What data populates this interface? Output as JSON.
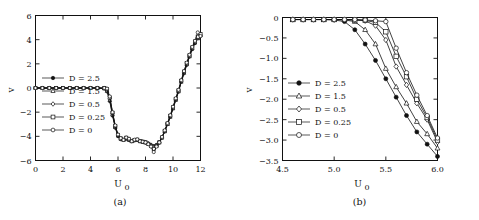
{
  "figure": {
    "panel_a_caption": "(a)",
    "panel_b_caption": "(b)"
  },
  "chart_data": [
    {
      "type": "line",
      "panel": "(a)",
      "title": "",
      "xlabel": "U_0",
      "ylabel": "v",
      "xlim": [
        0,
        12
      ],
      "ylim": [
        -6,
        6
      ],
      "xticks": [
        0,
        2,
        4,
        6,
        8,
        10,
        12
      ],
      "xticklabels": [
        "0",
        "2",
        "4",
        "6",
        "8",
        "10",
        "12"
      ],
      "yticks": [
        -6,
        -4,
        -2,
        0,
        2,
        4,
        6
      ],
      "yticklabels": [
        "-6",
        "-4",
        "-2",
        "0",
        "2",
        "4",
        "6"
      ],
      "grid": false,
      "legend_position": "center-left",
      "legend": [
        "D = 2.5",
        "D = 1.5",
        "D = 0.5",
        "D = 0.25",
        "D = 0"
      ],
      "markers": [
        "filled-circle",
        "triangle",
        "diamond",
        "square",
        "open-circle"
      ],
      "x": [
        0,
        0.5,
        1,
        1.5,
        2,
        2.5,
        3,
        3.5,
        4,
        4.5,
        5,
        5.2,
        5.4,
        5.6,
        5.8,
        6,
        6.2,
        6.4,
        6.6,
        6.8,
        7,
        7.2,
        7.4,
        7.6,
        7.8,
        8,
        8.2,
        8.4,
        8.6,
        8.8,
        9,
        9.2,
        9.4,
        9.6,
        9.8,
        10,
        10.2,
        10.4,
        10.6,
        10.8,
        11,
        11.2,
        11.4,
        11.6,
        11.8,
        12
      ],
      "series": [
        {
          "name": "D = 2.5",
          "values": [
            0,
            0,
            0,
            0,
            0,
            0,
            0,
            0,
            0,
            0,
            -0.05,
            -0.3,
            -1.1,
            -2.3,
            -3.3,
            -4.0,
            -4.25,
            -4.3,
            -4.2,
            -4.3,
            -4.4,
            -4.35,
            -4.3,
            -4.4,
            -4.45,
            -4.5,
            -4.6,
            -4.7,
            -4.8,
            -4.7,
            -4.5,
            -4.1,
            -3.6,
            -3.0,
            -2.4,
            -1.7,
            -1.0,
            -0.3,
            0.5,
            1.2,
            1.9,
            2.6,
            3.2,
            3.7,
            4.1,
            4.3
          ]
        },
        {
          "name": "D = 1.5",
          "values": [
            0,
            0,
            0,
            0,
            0,
            0,
            0,
            0,
            0,
            0,
            -0.04,
            -0.25,
            -1.0,
            -2.2,
            -3.25,
            -3.95,
            -4.2,
            -4.28,
            -4.2,
            -4.3,
            -4.4,
            -4.33,
            -4.3,
            -4.4,
            -4.45,
            -4.5,
            -4.6,
            -4.7,
            -4.85,
            -4.72,
            -4.5,
            -4.1,
            -3.6,
            -3.0,
            -2.4,
            -1.7,
            -1.0,
            -0.3,
            0.5,
            1.25,
            1.95,
            2.6,
            3.25,
            3.75,
            4.15,
            4.35
          ]
        },
        {
          "name": "D = 0.5",
          "values": [
            0,
            0,
            0,
            0,
            0,
            0,
            0,
            0,
            0,
            0,
            -0.02,
            -0.15,
            -0.85,
            -2.1,
            -3.2,
            -3.9,
            -4.2,
            -4.3,
            -4.15,
            -4.25,
            -4.4,
            -4.3,
            -4.3,
            -4.4,
            -4.45,
            -4.5,
            -4.6,
            -4.75,
            -4.95,
            -4.75,
            -4.5,
            -4.1,
            -3.55,
            -2.95,
            -2.35,
            -1.65,
            -0.95,
            -0.25,
            0.55,
            1.3,
            2.0,
            2.65,
            3.3,
            3.8,
            4.2,
            4.4
          ]
        },
        {
          "name": "D = 0.25",
          "values": [
            0,
            0,
            0,
            0,
            0,
            0,
            0,
            0,
            0,
            0,
            -0.01,
            -0.1,
            -0.8,
            -2.05,
            -3.15,
            -3.88,
            -4.18,
            -4.3,
            -4.12,
            -4.25,
            -4.4,
            -4.3,
            -4.28,
            -4.4,
            -4.45,
            -4.5,
            -4.62,
            -4.8,
            -5.05,
            -4.8,
            -4.5,
            -4.1,
            -3.55,
            -2.95,
            -2.3,
            -1.6,
            -0.9,
            -0.2,
            0.6,
            1.35,
            2.05,
            2.7,
            3.35,
            3.85,
            4.25,
            4.45
          ]
        },
        {
          "name": "D = 0",
          "values": [
            0,
            0,
            0,
            0,
            0,
            0,
            0,
            0,
            0,
            0,
            0,
            -0.05,
            -0.7,
            -2.0,
            -3.1,
            -3.85,
            -4.15,
            -4.3,
            -4.1,
            -4.2,
            -4.4,
            -4.28,
            -4.25,
            -4.4,
            -4.45,
            -4.5,
            -4.65,
            -4.85,
            -5.3,
            -4.85,
            -4.5,
            -4.05,
            -3.5,
            -2.9,
            -2.25,
            -1.55,
            -0.85,
            -0.15,
            0.65,
            1.4,
            2.1,
            2.75,
            3.4,
            3.9,
            4.6,
            4.3
          ]
        }
      ]
    },
    {
      "type": "line",
      "panel": "(b)",
      "title": "",
      "xlabel": "U_0",
      "ylabel": "v",
      "xlim": [
        4.5,
        6.0
      ],
      "ylim": [
        -3.5,
        0
      ],
      "xticks": [
        4.5,
        5.0,
        5.5,
        6.0
      ],
      "xticklabels": [
        "4.5",
        "5.0",
        "5.5",
        "6.0"
      ],
      "yticks": [
        -3.5,
        -3.0,
        -2.5,
        -2.0,
        -1.5,
        -1.0,
        -0.5,
        0
      ],
      "yticklabels": [
        "-3.5",
        "-3.0",
        "-2.5",
        "-2.0",
        "-1.5",
        "-1.0",
        "-0.5",
        "0"
      ],
      "grid": false,
      "legend_position": "center-left",
      "legend": [
        "D = 2.5",
        "D = 1.5",
        "D = 0.5",
        "D = 0.25",
        "D = 0"
      ],
      "markers": [
        "filled-circle",
        "triangle",
        "diamond",
        "square",
        "open-circle"
      ],
      "x": [
        4.6,
        4.7,
        4.8,
        4.9,
        5.0,
        5.1,
        5.2,
        5.3,
        5.4,
        5.5,
        5.6,
        5.7,
        5.8,
        5.9,
        6.0
      ],
      "series": [
        {
          "name": "D = 2.5",
          "values": [
            -0.05,
            -0.05,
            -0.05,
            -0.05,
            -0.06,
            -0.1,
            -0.3,
            -0.65,
            -1.05,
            -1.5,
            -1.95,
            -2.4,
            -2.8,
            -3.1,
            -3.4
          ]
        },
        {
          "name": "D = 1.5",
          "values": [
            -0.05,
            -0.05,
            -0.05,
            -0.05,
            -0.05,
            -0.06,
            -0.1,
            -0.3,
            -0.65,
            -1.25,
            -1.7,
            -2.1,
            -2.55,
            -2.85,
            -3.2
          ]
        },
        {
          "name": "D = 0.5",
          "values": [
            -0.05,
            -0.05,
            -0.05,
            -0.05,
            -0.05,
            -0.05,
            -0.06,
            -0.08,
            -0.2,
            -0.55,
            -1.2,
            -1.65,
            -2.1,
            -2.5,
            -3.05
          ]
        },
        {
          "name": "D = 0.25",
          "values": [
            -0.05,
            -0.05,
            -0.05,
            -0.05,
            -0.05,
            -0.05,
            -0.06,
            -0.07,
            -0.12,
            -0.35,
            -0.95,
            -1.45,
            -2.0,
            -2.45,
            -3.0
          ]
        },
        {
          "name": "D = 0",
          "values": [
            -0.05,
            -0.05,
            -0.05,
            -0.05,
            -0.05,
            -0.05,
            -0.05,
            -0.06,
            -0.08,
            -0.1,
            -0.75,
            -1.35,
            -1.9,
            -2.4,
            -2.95
          ]
        }
      ]
    }
  ]
}
